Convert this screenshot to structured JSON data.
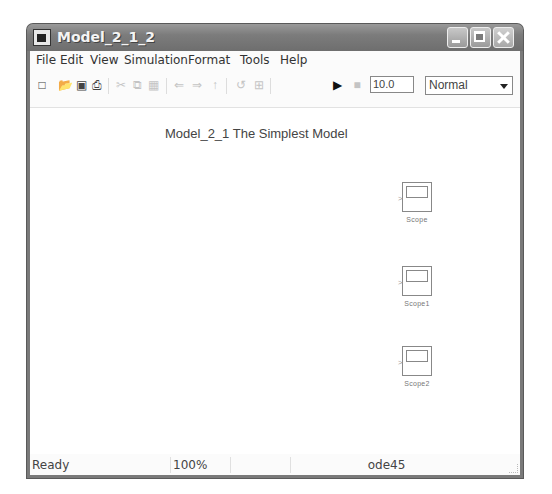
{
  "window": {
    "title": "Model_2_1_2"
  },
  "menu": [
    "File",
    "Edit",
    "View",
    "Simulation",
    "Format",
    "Tools",
    "Help"
  ],
  "toolbar": {
    "icons": [
      "new-icon",
      "open-icon",
      "save-icon",
      "print-icon",
      "cut-icon",
      "copy-icon",
      "paste-icon",
      "undo-icon",
      "redo-icon",
      "up-icon",
      "library-icon",
      "model-explorer-icon",
      "start-icon",
      "stop-icon"
    ],
    "stop_time": "10.0",
    "sim_mode": "Normal"
  },
  "canvas": {
    "annotation": "Model_2_1 The Simplest Model",
    "blocks": [
      {
        "label": "Scope"
      },
      {
        "label": "Scope1"
      },
      {
        "label": "Scope2"
      }
    ]
  },
  "statusbar": {
    "status": "Ready",
    "zoom": "100%",
    "solver": "ode45"
  }
}
